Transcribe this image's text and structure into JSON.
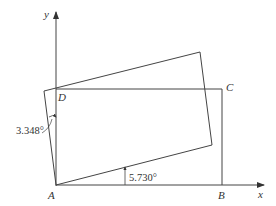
{
  "diagram": {
    "axes": {
      "x_label": "x",
      "y_label": "y"
    },
    "points": {
      "A": "A",
      "B": "B",
      "C": "C",
      "D": "D"
    },
    "angles": {
      "left": "3.348°",
      "bottom": "5.730°"
    },
    "colors": {
      "line": "#444444",
      "text": "#333333"
    }
  }
}
